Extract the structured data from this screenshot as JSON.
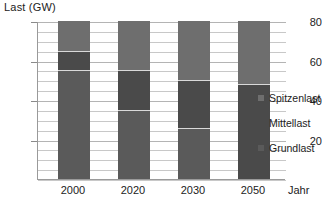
{
  "chart_data": {
    "type": "bar",
    "subtype": "stacked",
    "title": "",
    "ylabel": "Last (GW)",
    "xlabel": "Jahr",
    "categories": [
      "2000",
      "2020",
      "2030",
      "2050"
    ],
    "ylim": [
      0,
      80
    ],
    "y_ticks": [
      20,
      40,
      60,
      80
    ],
    "y_tick_labels": [
      "20",
      "40",
      "60",
      "80"
    ],
    "gridlines_every": 5,
    "grid": true,
    "legend_position": "right",
    "series": [
      {
        "name": "Spitzenlast",
        "color": "#6e6e6e",
        "values": [
          15,
          25,
          30,
          32
        ]
      },
      {
        "name": "Mittellast",
        "color": "#4a4a4a",
        "values": [
          10,
          20,
          24,
          48
        ]
      },
      {
        "name": "Grundlast",
        "color": "#5a5a5a",
        "values": [
          55,
          35,
          26,
          0
        ]
      }
    ],
    "totals": [
      80,
      80,
      80,
      80
    ],
    "stack_order_top_to_bottom": [
      "Spitzenlast",
      "Mittellast",
      "Grundlast"
    ]
  },
  "axis": {
    "y_title": "Last (GW)",
    "x_title": "Jahr"
  },
  "legend": {
    "items": [
      {
        "label": "Spitzenlast",
        "color": "#6e6e6e"
      },
      {
        "label": "Mittellast",
        "color": "#4a4a4a"
      },
      {
        "label": "Grundlast",
        "color": "#5a5a5a"
      }
    ]
  }
}
